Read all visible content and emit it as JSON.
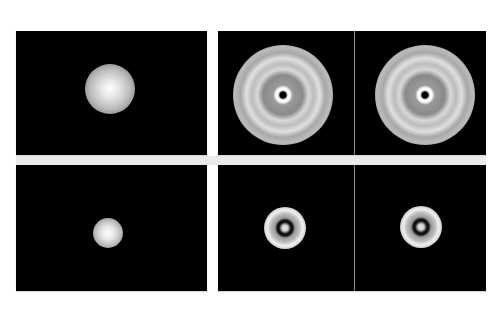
{
  "figure": {
    "layout": {
      "rows": 2,
      "columns": 2,
      "background": "#ffffff",
      "gap_band_color": "#ebebeb"
    },
    "panels": [
      {
        "id": "top-left",
        "content": "gaussian-spot",
        "subpanels": 1
      },
      {
        "id": "top-right",
        "content": "diffraction-pattern",
        "subpanels": 2
      },
      {
        "id": "bottom-left",
        "content": "spot-with-faint-ring",
        "subpanels": 1
      },
      {
        "id": "bottom-right",
        "content": "concentric-rings",
        "subpanels": 2
      }
    ]
  }
}
